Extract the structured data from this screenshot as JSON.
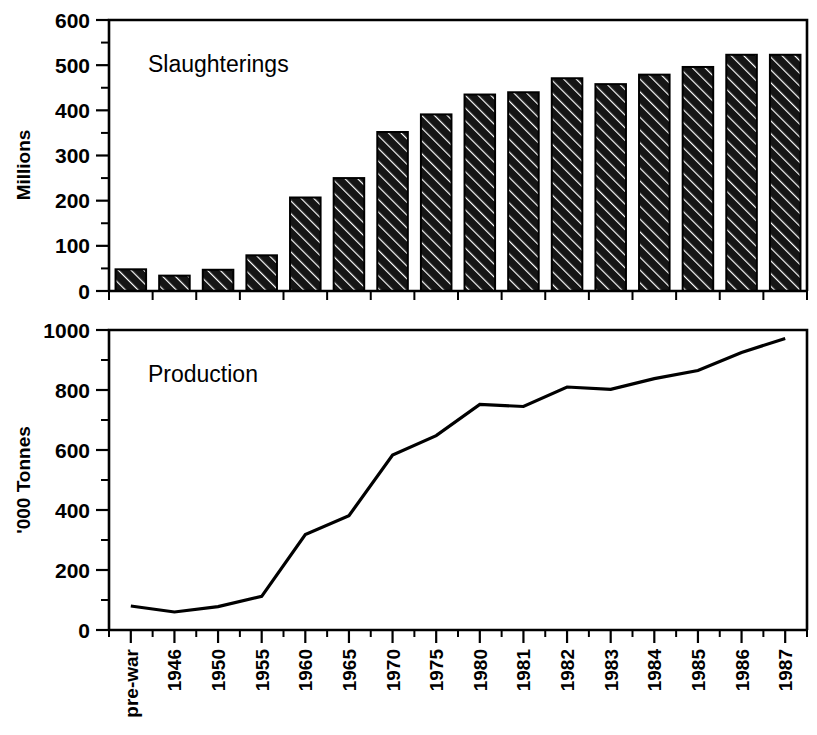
{
  "figure": {
    "background": "#ffffff",
    "ink_color": "#000000"
  },
  "chart_data": [
    {
      "type": "bar",
      "title": "Slaughterings",
      "xlabel": "",
      "ylabel": "Millions",
      "ylim": [
        0,
        600
      ],
      "yticks": [
        0,
        100,
        200,
        300,
        400,
        500,
        600
      ],
      "yticklabels": [
        "0",
        "100",
        "200",
        "300",
        "400",
        "500",
        "600"
      ],
      "minor_yticks": [
        50,
        150,
        250,
        350,
        450,
        550
      ],
      "grid": false,
      "legend": "none",
      "bar_fill": "#1a1a1a",
      "bar_hatch": "diagonal",
      "categories": [
        "pre-war",
        "1946",
        "1950",
        "1955",
        "1960",
        "1965",
        "1970",
        "1975",
        "1980",
        "1981",
        "1982",
        "1983",
        "1984",
        "1985",
        "1986",
        "1987"
      ],
      "values": [
        48,
        34,
        47,
        79,
        207,
        250,
        352,
        391,
        435,
        440,
        471,
        458,
        479,
        496,
        523,
        523
      ]
    },
    {
      "type": "line",
      "title": "Production",
      "xlabel": "",
      "ylabel": "'000 Tonnes",
      "ylim": [
        0,
        1000
      ],
      "yticks": [
        0,
        200,
        400,
        600,
        800,
        1000
      ],
      "yticklabels": [
        "0",
        "200",
        "400",
        "600",
        "800",
        "1000"
      ],
      "minor_yticks": [
        100,
        300,
        500,
        700,
        900
      ],
      "grid": false,
      "legend": "none",
      "line_color": "#000000",
      "categories": [
        "pre-war",
        "1946",
        "1950",
        "1955",
        "1960",
        "1965",
        "1970",
        "1975",
        "1980",
        "1981",
        "1982",
        "1983",
        "1984",
        "1985",
        "1986",
        "1987"
      ],
      "values": [
        80,
        60,
        78,
        112,
        318,
        381,
        583,
        648,
        752,
        745,
        810,
        802,
        838,
        865,
        925,
        972
      ]
    }
  ]
}
